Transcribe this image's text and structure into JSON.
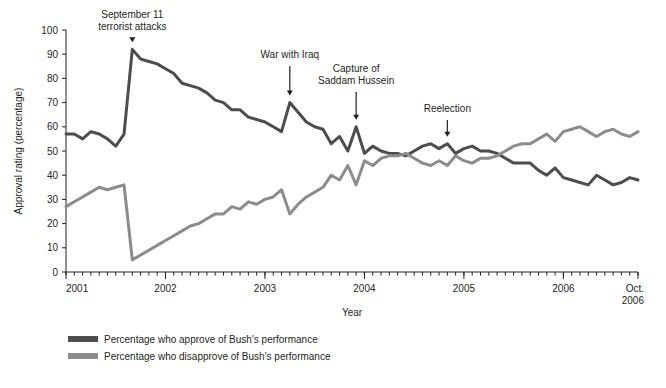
{
  "chart_data": {
    "type": "line",
    "title": "",
    "xlabel": "Year",
    "ylabel": "Approval rating (percentage)",
    "ylim": [
      0,
      100
    ],
    "ytick_step": 10,
    "yticks": [
      "0",
      "10",
      "20",
      "30",
      "40",
      "50",
      "60",
      "70",
      "80",
      "90",
      "100"
    ],
    "xlim": [
      "2001-01",
      "2006-10"
    ],
    "xticks": [
      "2001",
      "2002",
      "2003",
      "2004",
      "2005",
      "2006",
      "Oct. 2006"
    ],
    "xtick_labels": [
      "2001",
      "2002",
      "2003",
      "2004",
      "2005",
      "2006",
      "Oct.|2006"
    ],
    "x_minor_ticks": "monthly",
    "grid": false,
    "legend_position": "below-left",
    "series": [
      {
        "name": "Percentage who approve of Bush's performance",
        "color": "#4d4d4d",
        "values": [
          57,
          57,
          55,
          58,
          57,
          55,
          52,
          57,
          92,
          88,
          87,
          86,
          84,
          82,
          78,
          77,
          76,
          74,
          71,
          70,
          67,
          67,
          64,
          63,
          62,
          60,
          58,
          70,
          66,
          62,
          60,
          59,
          53,
          56,
          50,
          60,
          49,
          52,
          50,
          49,
          49,
          48,
          50,
          52,
          53,
          51,
          53,
          49,
          51,
          52,
          50,
          50,
          49,
          47,
          45,
          45,
          45,
          42,
          40,
          43,
          39,
          38,
          37,
          36,
          40,
          38,
          36,
          37,
          39,
          38
        ]
      },
      {
        "name": "Percentage who disapprove of Bush's performance",
        "color": "#8c8c8c",
        "values": [
          27,
          29,
          31,
          33,
          35,
          34,
          35,
          36,
          5,
          7,
          9,
          11,
          13,
          15,
          17,
          19,
          20,
          22,
          24,
          24,
          27,
          26,
          29,
          28,
          30,
          31,
          34,
          24,
          28,
          31,
          33,
          35,
          40,
          38,
          44,
          36,
          46,
          44,
          47,
          48,
          48,
          49,
          47,
          45,
          44,
          46,
          44,
          48,
          46,
          45,
          47,
          47,
          48,
          50,
          52,
          53,
          53,
          55,
          57,
          54,
          58,
          59,
          60,
          58,
          56,
          58,
          59,
          57,
          56,
          58
        ]
      }
    ],
    "annotations": [
      {
        "label": "September 11|terrorist attacks",
        "x_index": 8,
        "target_value": 92
      },
      {
        "label": "War with Iraq",
        "x_index": 27,
        "target_value": 70
      },
      {
        "label": "Capture of|Saddam Hussein",
        "x_index": 35,
        "target_value": 60
      },
      {
        "label": "Reelection",
        "x_index": 46,
        "target_value": 53
      }
    ]
  },
  "legend": {
    "items": [
      {
        "label": "Percentage who approve of Bush's performance",
        "color": "#4d4d4d"
      },
      {
        "label": "Percentage who disapprove of Bush's performance",
        "color": "#8c8c8c"
      }
    ]
  }
}
